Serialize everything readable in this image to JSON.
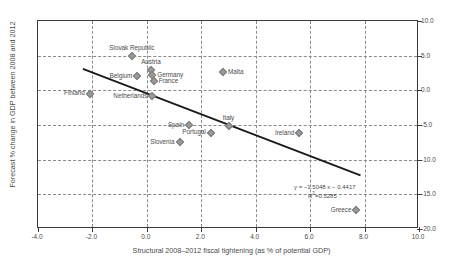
{
  "chart_data": {
    "type": "scatter",
    "title": "",
    "xlabel": "Structural 2008–2012 fiscal tightening (as % of potential GDP)",
    "ylabel": "Forecast % change in GDP between 2008 and 2012",
    "xlim": [
      -4.0,
      10.0
    ],
    "ylim": [
      -20.0,
      10.0
    ],
    "xticks": [
      "-4.0",
      "-2.0",
      "0.0",
      "2.0",
      "4.0",
      "6.0",
      "8.0",
      "10.0"
    ],
    "xtick_values": [
      -4.0,
      -2.0,
      0.0,
      2.0,
      4.0,
      6.0,
      8.0,
      10.0
    ],
    "yticks": [
      "10.0",
      "5.0",
      "0.0",
      "-5.0",
      "-10.0",
      "-15.0",
      "-20.0"
    ],
    "ytick_values": [
      10.0,
      5.0,
      0.0,
      -5.0,
      -10.0,
      -15.0,
      -20.0
    ],
    "grid": true,
    "grid_style": "dashed",
    "y_axis_position": "right",
    "legend": "none",
    "marker_shape": "diamond",
    "marker_color": "#9a9a9a",
    "points": [
      {
        "label": "Slovak Republic",
        "x": -0.55,
        "y": 5.0,
        "label_pos": "above"
      },
      {
        "label": "Belgium",
        "x": -0.35,
        "y": 2.0,
        "label_pos": "left"
      },
      {
        "label": "Austria",
        "x": 0.15,
        "y": 2.9,
        "label_pos": "above"
      },
      {
        "label": "Germany",
        "x": 0.2,
        "y": 2.2,
        "label_pos": "right"
      },
      {
        "label": "France",
        "x": 0.25,
        "y": 1.3,
        "label_pos": "right"
      },
      {
        "label": "Finland",
        "x": -2.1,
        "y": -0.5,
        "label_pos": "below-left"
      },
      {
        "label": "Netherlands",
        "x": 0.2,
        "y": -0.8,
        "label_pos": "left"
      },
      {
        "label": "Malta",
        "x": 2.8,
        "y": 2.7,
        "label_pos": "right"
      },
      {
        "label": "Spain",
        "x": 1.55,
        "y": -5.0,
        "label_pos": "left"
      },
      {
        "label": "Italy",
        "x": 3.0,
        "y": -5.1,
        "label_pos": "above"
      },
      {
        "label": "Portugal",
        "x": 2.35,
        "y": -6.2,
        "label_pos": "below-left"
      },
      {
        "label": "Ireland",
        "x": 5.6,
        "y": -6.1,
        "label_pos": "left"
      },
      {
        "label": "Slovenia",
        "x": 1.2,
        "y": -7.4,
        "label_pos": "left"
      },
      {
        "label": "Greece",
        "x": 7.7,
        "y": -17.3,
        "label_pos": "left"
      }
    ],
    "trendline": {
      "slope": -1.5048,
      "intercept": -0.4417,
      "r_squared": 0.5285,
      "x_start": -2.35,
      "x_end": 7.85,
      "equation_text": "y = −1.5048 x − 0.4417",
      "r2_text_prefix": "R",
      "r2_text_suffix": "=0.5285",
      "r2_exponent": "2",
      "color": "#1a1a1a"
    }
  },
  "annotations": {
    "equation_line1": "y = −1.5048 x − 0.4417",
    "equation_line2_prefix": "R",
    "equation_line2_exp": "2",
    "equation_line2_suffix": "=0.5285"
  }
}
